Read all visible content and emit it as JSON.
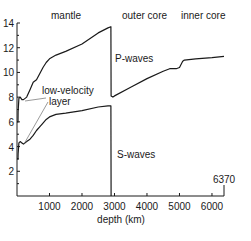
{
  "chart_data": {
    "type": "line",
    "title": "",
    "xlabel": "depth (km)",
    "ylabel": "",
    "xlim": [
      0,
      6370
    ],
    "ylim": [
      0,
      14
    ],
    "grid": false,
    "x_ticks": [
      1000,
      2000,
      3000,
      4000,
      5000,
      6000
    ],
    "x_tick_labels": [
      "1000",
      "2000",
      "3000",
      "4000",
      "5000",
      "6000"
    ],
    "x_end_label": "6370",
    "y_ticks": [
      2,
      4,
      6,
      8,
      10,
      12,
      14
    ],
    "y_tick_labels": [
      "2",
      "4",
      "6",
      "8",
      "10",
      "12",
      "14"
    ],
    "region_labels": [
      "mantle",
      "outer core",
      "inner core"
    ],
    "annotations": [
      "low-velocity",
      "layer"
    ],
    "series": [
      {
        "name": "P-waves",
        "x": [
          0,
          30,
          35,
          60,
          100,
          150,
          200,
          300,
          400,
          500,
          600,
          700,
          800,
          900,
          1000,
          1200,
          1500,
          2000,
          2500,
          2800,
          2890,
          2895,
          2950,
          3000,
          3500,
          4000,
          4500,
          4700,
          4900,
          5000,
          5100,
          5150,
          5500,
          6000,
          6370
        ],
        "y": [
          6.0,
          6.0,
          6.8,
          7.9,
          8.0,
          7.8,
          7.8,
          8.0,
          8.6,
          9.2,
          9.4,
          9.9,
          10.4,
          10.8,
          11.1,
          11.4,
          11.7,
          12.3,
          13.2,
          13.6,
          13.7,
          8.1,
          8.0,
          8.1,
          8.8,
          9.5,
          10.1,
          10.3,
          10.3,
          10.4,
          10.9,
          11.0,
          11.1,
          11.2,
          11.3
        ]
      },
      {
        "name": "S-waves",
        "x": [
          0,
          30,
          35,
          60,
          100,
          150,
          200,
          300,
          400,
          500,
          600,
          700,
          800,
          900,
          1000,
          1200,
          1500,
          2000,
          2500,
          2800,
          2890,
          2895
        ],
        "y": [
          3.0,
          3.0,
          3.4,
          4.3,
          4.4,
          4.3,
          4.2,
          4.4,
          4.6,
          4.9,
          5.3,
          5.6,
          5.9,
          6.2,
          6.4,
          6.6,
          6.7,
          6.9,
          7.2,
          7.3,
          7.3,
          0
        ]
      }
    ],
    "curve_labels": [
      "P-waves",
      "S-waves"
    ]
  }
}
